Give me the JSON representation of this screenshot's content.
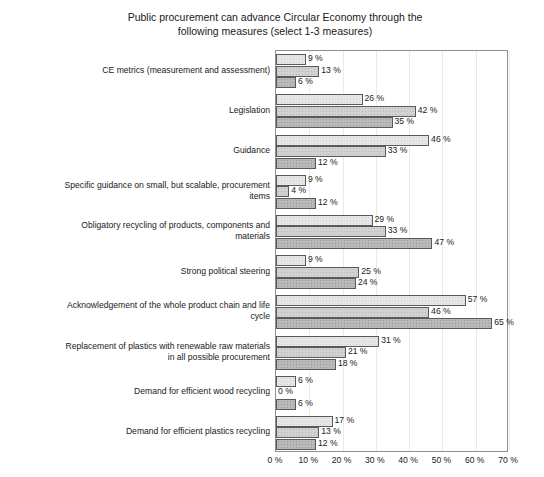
{
  "chart_data": {
    "type": "bar",
    "orientation": "horizontal",
    "title": "Public procurement can advance Circular Economy through the\nfollowing measures (select 1-3 measures)",
    "xlabel": "",
    "ylabel": "",
    "xlim": [
      0,
      70
    ],
    "xticks": [
      "0 %",
      "10 %",
      "20 %",
      "30 %",
      "40 %",
      "50 %",
      "60 %",
      "70 %"
    ],
    "xtick_values": [
      0,
      10,
      20,
      30,
      40,
      50,
      60,
      70
    ],
    "grid": true,
    "grid_axis": "x",
    "legend": false,
    "value_label_suffix": " %",
    "categories": [
      "CE metrics (measurement and assessment)",
      "Legislation",
      "Guidance",
      "Specific guidance on small, but scalable, procurement\nitems",
      "Obligatory recycling of products, components and\nmaterials",
      "Strong political steering",
      "Acknowledgement of the whole product chain and life\ncycle",
      "Replacement of plastics with renewable raw materials\nin all possible procurement",
      "Demand for efficient wood recycling",
      "Demand for efficient plastics recycling"
    ],
    "series": [
      {
        "name": "series-1",
        "color": "#e6e6e6",
        "values": [
          9,
          26,
          46,
          9,
          29,
          9,
          57,
          31,
          6,
          17
        ],
        "labels": [
          "9 %",
          "26 %",
          "46 %",
          "9 %",
          "29 %",
          "9 %",
          "57 %",
          "31 %",
          "6 %",
          "17 %"
        ]
      },
      {
        "name": "series-2",
        "color": "#d2d2d2",
        "values": [
          13,
          42,
          33,
          4,
          33,
          25,
          46,
          21,
          0,
          13
        ],
        "labels": [
          "13 %",
          "42 %",
          "33 %",
          "4 %",
          "33 %",
          "25 %",
          "46 %",
          "21 %",
          "0 %",
          "13 %"
        ]
      },
      {
        "name": "series-3",
        "color": "#b9b9b9",
        "values": [
          6,
          35,
          12,
          12,
          47,
          24,
          65,
          18,
          6,
          12
        ],
        "labels": [
          "6 %",
          "35 %",
          "12 %",
          "12 %",
          "47 %",
          "24 %",
          "65 %",
          "18 %",
          "6 %",
          "12 %"
        ]
      }
    ]
  }
}
